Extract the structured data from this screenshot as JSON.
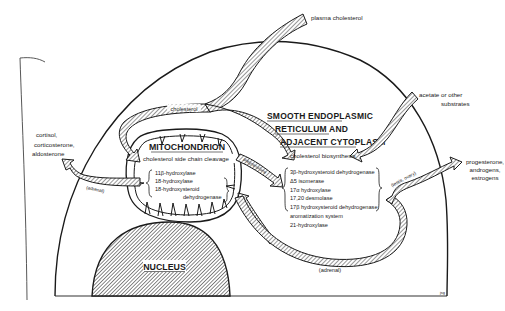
{
  "diagram": {
    "colors": {
      "line": "#1a1a1a",
      "hatch_fill": "#9a9a9a",
      "background": "#ffffff"
    },
    "compartments": {
      "mitochondrion": {
        "label": "MITOCHONDRION",
        "process": "cholesterol side chain cleavage",
        "enzymes": [
          "11β-hydroxylase",
          "18-hydroxylase",
          "18-hydroxysteroid",
          "dehydrogenase"
        ]
      },
      "er": {
        "label_lines": [
          "SMOOTH ENDOPLASMIC",
          "RETICULUM AND",
          "ADJACENT CYTOPLASM"
        ],
        "process": "cholesterol biosynthesis",
        "enzymes": [
          "3β-hydroxysteroid dehydrogenase",
          "Δ5 isomerase",
          "17α hydroxylase",
          "17,20 desmolase",
          "17β hydroxysteroid dehydrogenase",
          "aromatization system",
          "21-hydroxylase"
        ]
      },
      "nucleus": {
        "label": "NUCLEUS"
      }
    },
    "arrows": {
      "plasma_cholesterol": "plasma cholesterol",
      "cholesterol": "cholesterol",
      "acetate": [
        "acetate or other",
        "substrates"
      ],
      "pregnenolone": "pregnenolone",
      "adrenal_left": "(adrenal)",
      "adrenal_bottom": "(adrenal)",
      "testis_ovary": "(testis, ovary)"
    },
    "products": {
      "adrenal_products": [
        "cortisol,",
        "corticosterone,",
        "aldosterone"
      ],
      "gonadal_products": [
        "progesterone,",
        "androgens,",
        "estrogens"
      ]
    },
    "signature": "jsg"
  }
}
